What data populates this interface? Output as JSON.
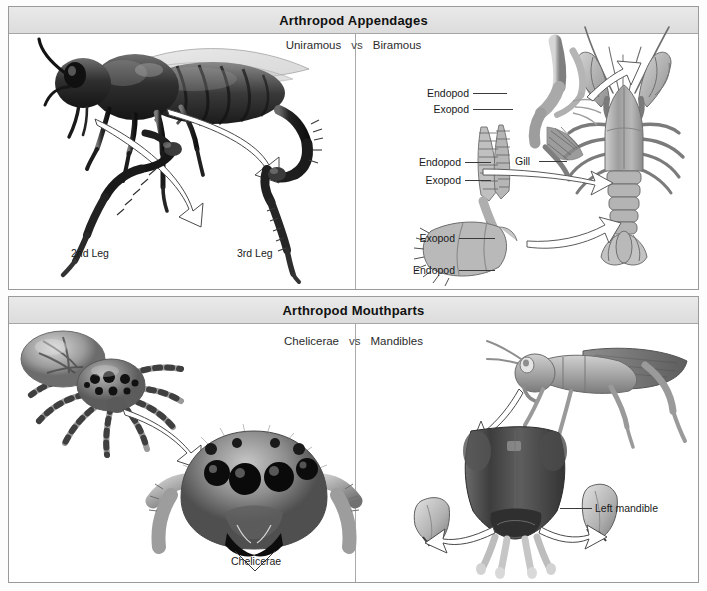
{
  "figure": {
    "panels": [
      {
        "id": "appendages",
        "title": "Arthropod Appendages",
        "subtitle": {
          "left": "Uniramous",
          "vs": "vs",
          "right": "Biramous"
        },
        "left_side": {
          "organism": "honeybee",
          "labels": [
            {
              "name": "leg-2-label",
              "text": "2nd Leg"
            },
            {
              "name": "leg-3-label",
              "text": "3rd Leg"
            }
          ]
        },
        "right_side": {
          "organism": "crayfish",
          "labels": [
            {
              "name": "walking-leg-endopod-label",
              "text": "Endopod"
            },
            {
              "name": "walking-leg-exopod-label",
              "text": "Exopod"
            },
            {
              "name": "gill-label",
              "text": "Gill"
            },
            {
              "name": "maxilliped-endopod-label",
              "text": "Endopod"
            },
            {
              "name": "maxilliped-exopod-label",
              "text": "Exopod"
            },
            {
              "name": "swimmeret-exopod-label",
              "text": "Exopod"
            },
            {
              "name": "swimmeret-endopod-label",
              "text": "Endopod"
            }
          ]
        }
      },
      {
        "id": "mouthparts",
        "title": "Arthropod Mouthparts",
        "subtitle": {
          "left": "Chelicerae",
          "vs": "vs",
          "right": "Mandibles"
        },
        "left_side": {
          "organism": "jumping-spider",
          "labels": [
            {
              "name": "chelicerae-label",
              "text": "Chelicerae"
            }
          ]
        },
        "right_side": {
          "organism": "grasshopper",
          "labels": [
            {
              "name": "left-mandible-label",
              "text": "Left mandible"
            }
          ]
        }
      }
    ]
  },
  "colors": {
    "banner_top": "#e9e9e9",
    "banner_bottom": "#dcdcdc",
    "border": "#9a9a9a",
    "text": "#111111",
    "leader": "#3a3a3a",
    "ink_dark": "#2b2b2b",
    "ink_mid": "#8d8d8d",
    "ink_light": "#c9c9c9"
  }
}
